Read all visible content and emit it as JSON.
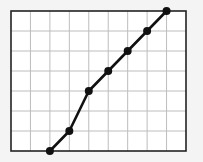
{
  "chart_data": {
    "type": "line",
    "title": "",
    "xlabel": "",
    "ylabel": "",
    "x": [
      2,
      3,
      4,
      5,
      6,
      7,
      8
    ],
    "series": [
      {
        "name": "",
        "values": [
          0,
          1,
          3,
          4,
          5,
          6,
          7
        ]
      }
    ],
    "xlim": [
      0,
      9
    ],
    "ylim": [
      0,
      7
    ],
    "grid": true,
    "legend": "none",
    "colors": {
      "line": "#111111",
      "grid": "#bdbdbd",
      "frame": "#222222",
      "background": "#ffffff"
    }
  }
}
